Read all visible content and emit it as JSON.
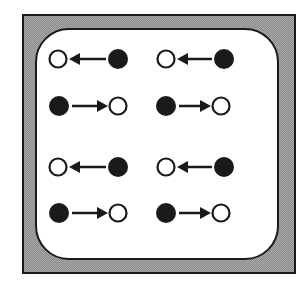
{
  "diagram": {
    "title": "",
    "colors": {
      "ink": "#1a1a1a",
      "panel": "#ffffff",
      "frame": "#a8a8a8"
    },
    "pairs": [
      {
        "row": 1,
        "col": 1,
        "open_x": 58,
        "filled_x": 118,
        "y": 59,
        "direction": "left"
      },
      {
        "row": 1,
        "col": 2,
        "open_x": 166,
        "filled_x": 224,
        "y": 59,
        "direction": "left"
      },
      {
        "row": 2,
        "col": 1,
        "open_x": 118,
        "filled_x": 59,
        "y": 106,
        "direction": "right"
      },
      {
        "row": 2,
        "col": 2,
        "open_x": 221,
        "filled_x": 166,
        "y": 106,
        "direction": "right"
      },
      {
        "row": 3,
        "col": 1,
        "open_x": 58,
        "filled_x": 118,
        "y": 167,
        "direction": "left"
      },
      {
        "row": 3,
        "col": 2,
        "open_x": 166,
        "filled_x": 224,
        "y": 167,
        "direction": "left"
      },
      {
        "row": 4,
        "col": 1,
        "open_x": 118,
        "filled_x": 59,
        "y": 213,
        "direction": "right"
      },
      {
        "row": 4,
        "col": 2,
        "open_x": 221,
        "filled_x": 166,
        "y": 213,
        "direction": "right"
      }
    ]
  }
}
